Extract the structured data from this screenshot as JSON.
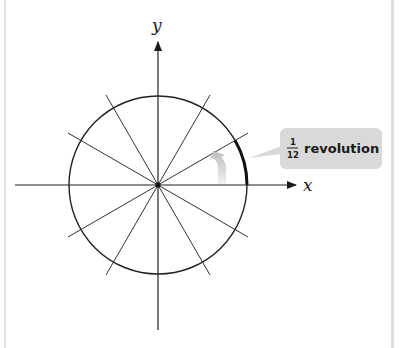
{
  "diagram": {
    "type": "unit-circle-divisions",
    "axes": {
      "x_label": "x",
      "y_label": "y"
    },
    "divisions": 12,
    "callout": {
      "fraction_numerator": "1",
      "fraction_denominator": "12",
      "text": "revolution"
    },
    "colors": {
      "stroke": "#1a1a1a",
      "callout_bg": "#d9d9d9",
      "arrow_fill": "#c8c8c8"
    }
  }
}
